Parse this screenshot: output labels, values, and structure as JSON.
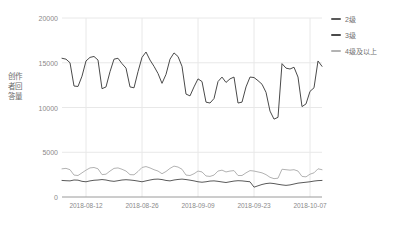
{
  "chart_data": {
    "type": "line",
    "title": "",
    "xlabel": "",
    "ylabel": "创作者回答量",
    "ylim": [
      0,
      20000
    ],
    "yticks": [
      "0",
      "5000",
      "10000",
      "15000",
      "20000"
    ],
    "ytick_values": [
      0,
      5000,
      10000,
      15000,
      20000
    ],
    "xticks": [
      "2018-08-12",
      "2018-08-26",
      "2018-09-09",
      "2018-09-23",
      "2018-10-07"
    ],
    "xtick_indices": [
      6,
      20,
      34,
      48,
      62
    ],
    "grid": true,
    "legend_position": "right",
    "x": [
      "2018-08-06",
      "2018-08-07",
      "2018-08-08",
      "2018-08-09",
      "2018-08-10",
      "2018-08-11",
      "2018-08-12",
      "2018-08-13",
      "2018-08-14",
      "2018-08-15",
      "2018-08-16",
      "2018-08-17",
      "2018-08-18",
      "2018-08-19",
      "2018-08-20",
      "2018-08-21",
      "2018-08-22",
      "2018-08-23",
      "2018-08-24",
      "2018-08-25",
      "2018-08-26",
      "2018-08-27",
      "2018-08-28",
      "2018-08-29",
      "2018-08-30",
      "2018-08-31",
      "2018-09-01",
      "2018-09-02",
      "2018-09-03",
      "2018-09-04",
      "2018-09-05",
      "2018-09-06",
      "2018-09-07",
      "2018-09-08",
      "2018-09-09",
      "2018-09-10",
      "2018-09-11",
      "2018-09-12",
      "2018-09-13",
      "2018-09-14",
      "2018-09-15",
      "2018-09-16",
      "2018-09-17",
      "2018-09-18",
      "2018-09-19",
      "2018-09-20",
      "2018-09-21",
      "2018-09-22",
      "2018-09-23",
      "2018-09-24",
      "2018-09-25",
      "2018-09-26",
      "2018-09-27",
      "2018-09-28",
      "2018-09-29",
      "2018-09-30",
      "2018-10-01",
      "2018-10-02",
      "2018-10-03",
      "2018-10-04",
      "2018-10-05",
      "2018-10-06",
      "2018-10-07",
      "2018-10-08",
      "2018-10-09",
      "2018-10-10"
    ],
    "series": [
      {
        "name": "2级",
        "color": "#5a5a5a",
        "values": [
          1850,
          1820,
          1800,
          1900,
          1880,
          1750,
          1700,
          1800,
          1870,
          1900,
          1950,
          1900,
          1800,
          1750,
          1820,
          1900,
          1930,
          1900,
          1850,
          1780,
          1700,
          1800,
          1900,
          1980,
          2000,
          1950,
          1850,
          1800,
          1900,
          1960,
          2000,
          1950,
          1880,
          1800,
          1700,
          1650,
          1700,
          1780,
          1800,
          1750,
          1680,
          1620,
          1700,
          1780,
          1820,
          1800,
          1750,
          1700,
          1100,
          1250,
          1400,
          1500,
          1550,
          1500,
          1420,
          1350,
          1300,
          1350,
          1450,
          1550,
          1600,
          1650,
          1700,
          1780,
          1830,
          1850
        ]
      },
      {
        "name": "3级",
        "color": "#4a4a4a",
        "values": [
          15500,
          15400,
          15000,
          12400,
          12350,
          13500,
          15200,
          15600,
          15700,
          15300,
          12100,
          12300,
          14000,
          15400,
          15500,
          14900,
          14400,
          12300,
          12200,
          14000,
          15600,
          16200,
          15300,
          14600,
          13800,
          12700,
          13700,
          15400,
          16100,
          15700,
          14600,
          11500,
          11300,
          12300,
          13200,
          12900,
          10600,
          10500,
          11000,
          12900,
          13400,
          12800,
          13200,
          13400,
          10500,
          10600,
          12300,
          13400,
          13350,
          13000,
          12600,
          11700,
          9600,
          8700,
          8900,
          14900,
          14400,
          14300,
          14500,
          13400,
          10100,
          10400,
          11800,
          12200,
          15200,
          14600
        ]
      },
      {
        "name": "4级及以上",
        "color": "#b3b3b3",
        "values": [
          3150,
          3200,
          3050,
          2450,
          2400,
          2700,
          3000,
          3250,
          3300,
          3150,
          2500,
          2550,
          2900,
          3200,
          3250,
          3100,
          2900,
          2500,
          2480,
          2850,
          3300,
          3400,
          3250,
          3050,
          2900,
          2600,
          2850,
          3200,
          3450,
          3350,
          3100,
          2450,
          2400,
          2600,
          2900,
          2800,
          2350,
          2300,
          2450,
          2900,
          3000,
          2800,
          2900,
          2950,
          2400,
          2400,
          2700,
          2950,
          2900,
          2800,
          2700,
          2500,
          2200,
          2050,
          2100,
          3100,
          3050,
          3000,
          3050,
          2900,
          2300,
          2250,
          2550,
          2700,
          3150,
          3050
        ]
      }
    ]
  },
  "legend": {
    "items": [
      {
        "label": "2级"
      },
      {
        "label": "3级"
      },
      {
        "label": "4级及以上"
      }
    ]
  },
  "axis": {
    "y_title": "创作者回答量"
  },
  "colors": {
    "grid": "#e8e8e8",
    "baseline": "#9a9a9a",
    "tick_text": "#8a8a8a"
  }
}
